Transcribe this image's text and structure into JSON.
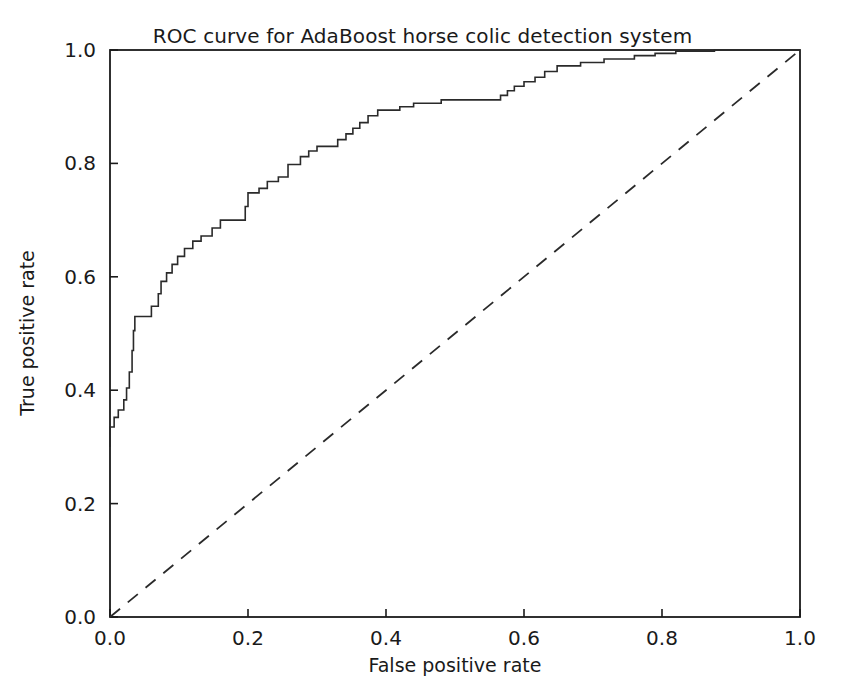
{
  "chart_data": {
    "type": "line",
    "title": "ROC curve for AdaBoost horse colic detection system",
    "xlabel": "False positive rate",
    "ylabel": "True positive rate",
    "xlim": [
      0.0,
      1.0
    ],
    "ylim": [
      0.0,
      1.0
    ],
    "grid": false,
    "legend": null,
    "xticks": [
      0.0,
      0.2,
      0.4,
      0.6,
      0.8,
      1.0
    ],
    "xtick_labels": [
      "0.0",
      "0.2",
      "0.4",
      "0.6",
      "0.8",
      "1.0"
    ],
    "yticks": [
      0.0,
      0.2,
      0.4,
      0.6,
      0.8,
      1.0
    ],
    "ytick_labels": [
      "0.0",
      "0.2",
      "0.4",
      "0.6",
      "0.8",
      "1.0"
    ],
    "series": [
      {
        "name": "ROC curve",
        "style": "solid-step",
        "color": "#2a2a2a",
        "line_width": 1.6,
        "points": [
          [
            0.0,
            0.3
          ],
          [
            0.0,
            0.335
          ],
          [
            0.006,
            0.335
          ],
          [
            0.006,
            0.352
          ],
          [
            0.012,
            0.352
          ],
          [
            0.012,
            0.365
          ],
          [
            0.02,
            0.365
          ],
          [
            0.02,
            0.383
          ],
          [
            0.024,
            0.383
          ],
          [
            0.024,
            0.404
          ],
          [
            0.028,
            0.404
          ],
          [
            0.028,
            0.432
          ],
          [
            0.032,
            0.432
          ],
          [
            0.032,
            0.47
          ],
          [
            0.034,
            0.47
          ],
          [
            0.034,
            0.505
          ],
          [
            0.036,
            0.505
          ],
          [
            0.036,
            0.53
          ],
          [
            0.06,
            0.53
          ],
          [
            0.06,
            0.548
          ],
          [
            0.07,
            0.548
          ],
          [
            0.07,
            0.57
          ],
          [
            0.074,
            0.57
          ],
          [
            0.074,
            0.592
          ],
          [
            0.082,
            0.592
          ],
          [
            0.082,
            0.607
          ],
          [
            0.09,
            0.607
          ],
          [
            0.09,
            0.622
          ],
          [
            0.098,
            0.622
          ],
          [
            0.098,
            0.636
          ],
          [
            0.108,
            0.636
          ],
          [
            0.108,
            0.65
          ],
          [
            0.12,
            0.65
          ],
          [
            0.12,
            0.663
          ],
          [
            0.132,
            0.663
          ],
          [
            0.132,
            0.672
          ],
          [
            0.148,
            0.672
          ],
          [
            0.148,
            0.686
          ],
          [
            0.16,
            0.686
          ],
          [
            0.16,
            0.7
          ],
          [
            0.196,
            0.7
          ],
          [
            0.196,
            0.724
          ],
          [
            0.2,
            0.724
          ],
          [
            0.2,
            0.748
          ],
          [
            0.216,
            0.748
          ],
          [
            0.216,
            0.756
          ],
          [
            0.228,
            0.756
          ],
          [
            0.228,
            0.768
          ],
          [
            0.244,
            0.768
          ],
          [
            0.244,
            0.776
          ],
          [
            0.258,
            0.776
          ],
          [
            0.258,
            0.798
          ],
          [
            0.276,
            0.798
          ],
          [
            0.276,
            0.812
          ],
          [
            0.288,
            0.812
          ],
          [
            0.288,
            0.822
          ],
          [
            0.3,
            0.822
          ],
          [
            0.3,
            0.83
          ],
          [
            0.33,
            0.83
          ],
          [
            0.33,
            0.842
          ],
          [
            0.342,
            0.842
          ],
          [
            0.342,
            0.852
          ],
          [
            0.352,
            0.852
          ],
          [
            0.352,
            0.862
          ],
          [
            0.362,
            0.862
          ],
          [
            0.362,
            0.872
          ],
          [
            0.374,
            0.872
          ],
          [
            0.374,
            0.884
          ],
          [
            0.388,
            0.884
          ],
          [
            0.388,
            0.894
          ],
          [
            0.42,
            0.894
          ],
          [
            0.42,
            0.9
          ],
          [
            0.44,
            0.9
          ],
          [
            0.44,
            0.906
          ],
          [
            0.48,
            0.906
          ],
          [
            0.48,
            0.912
          ],
          [
            0.566,
            0.912
          ],
          [
            0.566,
            0.92
          ],
          [
            0.576,
            0.92
          ],
          [
            0.576,
            0.928
          ],
          [
            0.586,
            0.928
          ],
          [
            0.586,
            0.936
          ],
          [
            0.6,
            0.936
          ],
          [
            0.6,
            0.944
          ],
          [
            0.616,
            0.944
          ],
          [
            0.616,
            0.952
          ],
          [
            0.63,
            0.952
          ],
          [
            0.63,
            0.962
          ],
          [
            0.648,
            0.962
          ],
          [
            0.648,
            0.972
          ],
          [
            0.682,
            0.972
          ],
          [
            0.682,
            0.978
          ],
          [
            0.716,
            0.978
          ],
          [
            0.716,
            0.984
          ],
          [
            0.76,
            0.984
          ],
          [
            0.76,
            0.99
          ],
          [
            0.79,
            0.99
          ],
          [
            0.79,
            0.994
          ],
          [
            0.82,
            0.994
          ],
          [
            0.82,
            0.998
          ],
          [
            0.876,
            0.998
          ],
          [
            0.876,
            1.0
          ],
          [
            1.0,
            1.0
          ]
        ]
      },
      {
        "name": "Random classifier reference",
        "style": "dashed",
        "color": "#2a2a2a",
        "line_width": 1.8,
        "points": [
          [
            0.0,
            0.0
          ],
          [
            1.0,
            1.0
          ]
        ]
      }
    ]
  }
}
